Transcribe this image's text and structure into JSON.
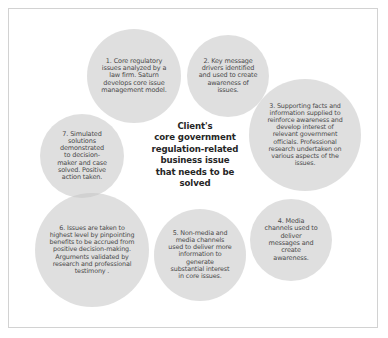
{
  "diagram": {
    "type": "overlapping-circles-process-diagram",
    "center": {
      "text": "Client's\ncore government\nregulation-related\nbusiness issue\nthat needs to be\nsolved"
    },
    "style": {
      "canvas_background": "#ffffff",
      "frame_border_color": "#d2d2d2",
      "circle_fill": "#c4c4c4",
      "circle_text_color": "#4a4a4a",
      "center_text_color": "#262626"
    },
    "circles": [
      {
        "number": "1",
        "text": "1. Core regulatory\nissues analyzed by a\nlaw firm. Saturn\ndevelops core issue\nmanagement model."
      },
      {
        "number": "2",
        "text": "2. Key message\ndrivers identified\nand used to create\nawareness of\nissues."
      },
      {
        "number": "3",
        "text": "3. Supporting facts and\ninformation supplied to\nreinforce awareness and\ndevelop interest of\nrelevant government\nofficials. Professional\nresearch undertaken on\nvarious aspects of the\nissues."
      },
      {
        "number": "4",
        "text": "4. Media\nchannels used to\ndeliver\nmessages and\ncreate\nawareness."
      },
      {
        "number": "5",
        "text": "5. Non-media and\nmedia channels\nused to deliver more\ninformation to\ngenerate\nsubstantial interest\nin core issues."
      },
      {
        "number": "6",
        "text": "6.  Issues are taken to\nhighest level by pinpointing\nbenefits to be accrued from\npositive decision-making.\nArguments validated by\nresearch and professional\ntestimony ."
      },
      {
        "number": "7",
        "text": "7. Simulated\nsolutions\ndemonstrated\nto decision-\nmaker and case\nsolved. Positive\naction taken."
      }
    ]
  }
}
